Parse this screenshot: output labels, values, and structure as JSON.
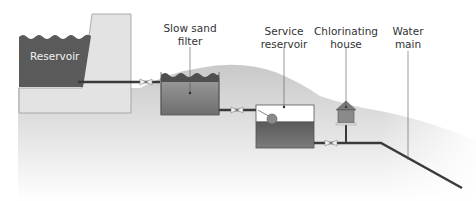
{
  "diagram": {
    "title": "",
    "labels": {
      "reservoir": "Reservoir",
      "slow_sand_filter": [
        "Slow sand",
        "filter"
      ],
      "service_reservoir": [
        "Service",
        "reservoir"
      ],
      "chlorinating_house": [
        "Chlorinating",
        "house"
      ],
      "water_main": [
        "Water",
        "main"
      ]
    },
    "colors": {
      "water_dark": "#5a5a5a",
      "water_mid": "#7a7a7a",
      "dam": "#e2e2e2",
      "ground": "#cfcfcf",
      "pipe": "#3a3a3a",
      "text": "#333333"
    }
  }
}
